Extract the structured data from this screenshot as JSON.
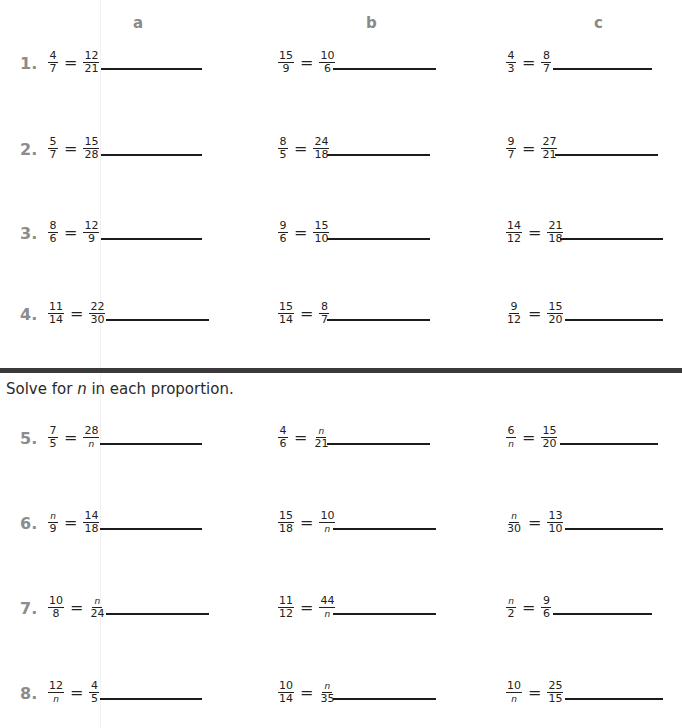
{
  "columns": [
    {
      "label": "a",
      "x": 133
    },
    {
      "label": "b",
      "x": 366
    },
    {
      "label": "c",
      "x": 594
    }
  ],
  "instruction": {
    "before": "Solve for ",
    "variable": "n",
    "after": " in each proportion."
  },
  "problems": [
    {
      "number": "1.",
      "top": 42,
      "items": [
        {
          "left_n": "4",
          "left_d": "7",
          "right_n": "12",
          "right_d": "21"
        },
        {
          "left_n": "15",
          "left_d": "9",
          "right_n": "10",
          "right_d": "6"
        },
        {
          "left_n": "4",
          "left_d": "3",
          "right_n": "8",
          "right_d": "7"
        }
      ]
    },
    {
      "number": "2.",
      "top": 128,
      "items": [
        {
          "left_n": "5",
          "left_d": "7",
          "right_n": "15",
          "right_d": "28"
        },
        {
          "left_n": "8",
          "left_d": "5",
          "right_n": "24",
          "right_d": "18"
        },
        {
          "left_n": "9",
          "left_d": "7",
          "right_n": "27",
          "right_d": "21"
        }
      ]
    },
    {
      "number": "3.",
      "top": 212,
      "items": [
        {
          "left_n": "8",
          "left_d": "6",
          "right_n": "12",
          "right_d": "9"
        },
        {
          "left_n": "9",
          "left_d": "6",
          "right_n": "15",
          "right_d": "10"
        },
        {
          "left_n": "14",
          "left_d": "12",
          "right_n": "21",
          "right_d": "18"
        }
      ]
    },
    {
      "number": "4.",
      "top": 293,
      "items": [
        {
          "left_n": "11",
          "left_d": "14",
          "right_n": "22",
          "right_d": "30"
        },
        {
          "left_n": "15",
          "left_d": "14",
          "right_n": "8",
          "right_d": "7"
        },
        {
          "left_n": "9",
          "left_d": "12",
          "right_n": "15",
          "right_d": "20"
        }
      ]
    },
    {
      "number": "5.",
      "top": 417,
      "items": [
        {
          "left_n": "7",
          "left_d": "5",
          "right_n": "28",
          "right_d": "n"
        },
        {
          "left_n": "4",
          "left_d": "6",
          "right_n": "n",
          "right_d": "21"
        },
        {
          "left_n": "6",
          "left_d": "n",
          "right_n": "15",
          "right_d": "20"
        }
      ]
    },
    {
      "number": "6.",
      "top": 502,
      "items": [
        {
          "left_n": "n",
          "left_d": "9",
          "right_n": "14",
          "right_d": "18"
        },
        {
          "left_n": "15",
          "left_d": "18",
          "right_n": "10",
          "right_d": "n"
        },
        {
          "left_n": "n",
          "left_d": "30",
          "right_n": "13",
          "right_d": "10"
        }
      ]
    },
    {
      "number": "7.",
      "top": 587,
      "items": [
        {
          "left_n": "10",
          "left_d": "8",
          "right_n": "n",
          "right_d": "24"
        },
        {
          "left_n": "11",
          "left_d": "12",
          "right_n": "44",
          "right_d": "n"
        },
        {
          "left_n": "n",
          "left_d": "2",
          "right_n": "9",
          "right_d": "6"
        }
      ]
    },
    {
      "number": "8.",
      "top": 672,
      "items": [
        {
          "left_n": "12",
          "left_d": "n",
          "right_n": "4",
          "right_d": "5"
        },
        {
          "left_n": "10",
          "left_d": "14",
          "right_n": "n",
          "right_d": "35"
        },
        {
          "left_n": "10",
          "left_d": "n",
          "right_n": "25",
          "right_d": "15"
        }
      ]
    }
  ]
}
